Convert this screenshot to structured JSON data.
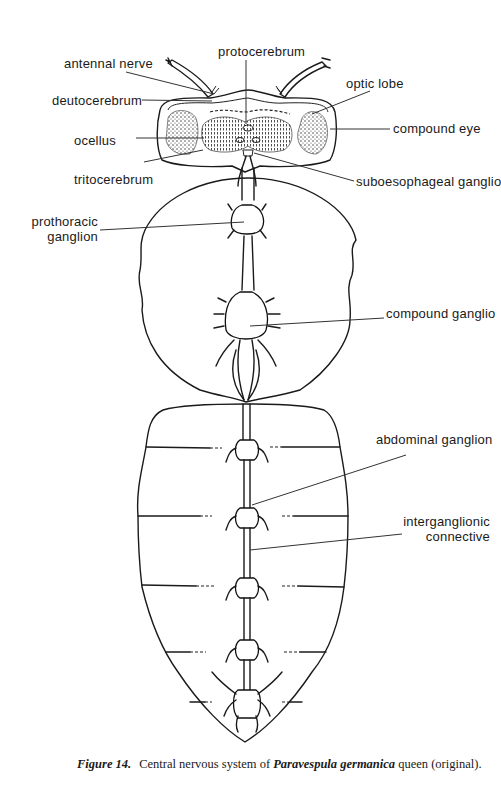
{
  "figure": {
    "caption": {
      "figure_number": "Figure 14.",
      "text_before": "Central nervous system of ",
      "species": "Paravespula germanica",
      "text_after": " queen (original)."
    },
    "labels": {
      "protocerebrum": "protocerebrum",
      "antennal_nerve": "antennal nerve",
      "deutocerebrum": "deutocerebrum",
      "optic_lobe": "optic lobe",
      "ocellus": "ocellus",
      "compound_eye": "compound eye",
      "tritocerebrum": "tritocerebrum",
      "suboesophageal_ganglion": "suboesophageal ganglio",
      "prothoracic_ganglion_line1": "prothoracic",
      "prothoracic_ganglion_line2": "ganglion",
      "compound_ganglion": "compound ganglio",
      "abdominal_ganglion": "abdominal ganglion",
      "interganglionic_connective_line1": "interganglionic",
      "interganglionic_connective_line2": "connective"
    },
    "colors": {
      "ink": "#1a1a1a",
      "paper": "#ffffff"
    }
  }
}
